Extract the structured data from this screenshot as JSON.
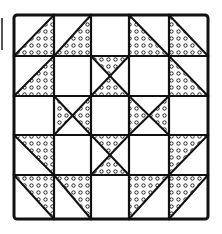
{
  "figure": {
    "title": "",
    "colors": {
      "line": "#111111",
      "fill_background": "#ffffff",
      "dot": "#111111"
    },
    "grid": {
      "rows": 5,
      "cols": 5,
      "col_edges": [
        14,
        54,
        91,
        129,
        169,
        208
      ],
      "row_edges": [
        15,
        56,
        96,
        135,
        175,
        219
      ]
    },
    "cells": [
      [
        "hst-dots-lower-right",
        "hst-dots-lower-right",
        "blank",
        "hst-dots-lower-left",
        "hst-dots-lower-left"
      ],
      [
        "hst-dots-lower-right",
        "blank",
        "hourglass-dots-top-bottom",
        "blank",
        "hst-dots-lower-left"
      ],
      [
        "blank",
        "hourglass-dots-left-right",
        "blank",
        "hourglass-dots-left-right",
        "blank"
      ],
      [
        "hst-dots-upper-right",
        "blank",
        "hourglass-dots-top-bottom",
        "blank",
        "hst-dots-upper-left"
      ],
      [
        "hst-dots-upper-right",
        "hst-dots-upper-right",
        "blank",
        "hst-dots-upper-left",
        "hst-dots-upper-left"
      ]
    ]
  }
}
